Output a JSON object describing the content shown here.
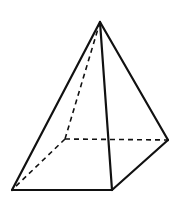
{
  "figure": {
    "view": "oblique",
    "stroke_color": "#111111",
    "background": "#ffffff",
    "vertices": {
      "apex": [
        100,
        22
      ],
      "front_left": [
        12,
        190
      ],
      "front_right": [
        112,
        190
      ],
      "back_right": [
        168,
        140
      ],
      "back_left_hidden": [
        65,
        139
      ]
    },
    "visible_edges": [
      [
        "apex",
        "front_left"
      ],
      [
        "apex",
        "front_right"
      ],
      [
        "apex",
        "back_right"
      ],
      [
        "front_left",
        "front_right"
      ],
      [
        "front_right",
        "back_right"
      ]
    ],
    "hidden_edges": [
      [
        "apex",
        "back_left_hidden"
      ],
      [
        "back_left_hidden",
        "front_left"
      ],
      [
        "back_left_hidden",
        "back_right"
      ]
    ]
  }
}
